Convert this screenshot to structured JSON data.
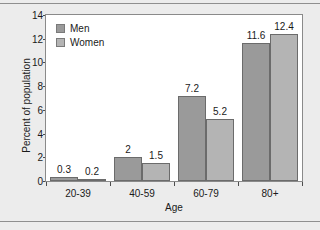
{
  "chart_data": {
    "type": "bar",
    "title": "",
    "xlabel": "Age",
    "ylabel": "Percent of population",
    "categories": [
      "20-39",
      "40-59",
      "60-79",
      "80+"
    ],
    "series": [
      {
        "name": "Men",
        "color": "#9a9a9a",
        "values": [
          0.3,
          2,
          7.2,
          11.6
        ],
        "value_labels": [
          "0.3",
          "2",
          "7.2",
          "11.6"
        ]
      },
      {
        "name": "Women",
        "color": "#b4b4b4",
        "values": [
          0.2,
          1.5,
          5.2,
          12.4
        ],
        "value_labels": [
          "0.2",
          "1.5",
          "5.2",
          "12.4"
        ]
      }
    ],
    "ylim": [
      0,
      14
    ],
    "yticks": [
      0,
      2,
      4,
      6,
      8,
      10,
      12,
      14
    ],
    "ytick_labels": [
      "0",
      "2",
      "4",
      "6",
      "8",
      "10",
      "12",
      "14"
    ],
    "grid": false,
    "legend_position": "top-left",
    "legend_entries": [
      "Men",
      "Women"
    ]
  },
  "figure": {
    "background_color": "#ececec",
    "plot_background_color": "#ffffff",
    "frame_color": "#8a8a8a"
  }
}
